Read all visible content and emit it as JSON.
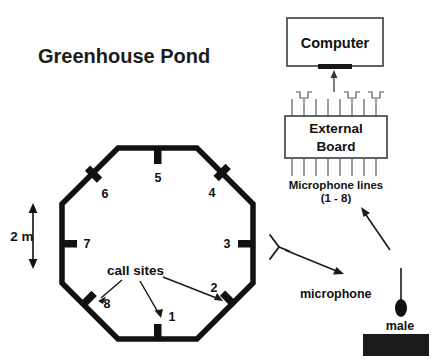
{
  "title": "Greenhouse Pond",
  "scale": {
    "label": "2 m",
    "icon": "double-headed-arrow-icon"
  },
  "pond": {
    "name": "octagonal pond outline",
    "shape": "octagon",
    "stroke_color": "#111111",
    "microphones": [
      {
        "id": "1",
        "label": "1",
        "edge": "bottom"
      },
      {
        "id": "2",
        "label": "2",
        "edge": "bottom-right"
      },
      {
        "id": "3",
        "label": "3",
        "edge": "right"
      },
      {
        "id": "4",
        "label": "4",
        "edge": "top-right"
      },
      {
        "id": "5",
        "label": "5",
        "edge": "top"
      },
      {
        "id": "6",
        "label": "6",
        "edge": "top-left"
      },
      {
        "id": "7",
        "label": "7",
        "edge": "left"
      },
      {
        "id": "8",
        "label": "8",
        "edge": "bottom-left"
      }
    ]
  },
  "annotations": {
    "call_sites": "call sites",
    "microphone": "microphone",
    "male": "male",
    "microphone_lines": "Microphone lines",
    "microphone_lines_range": "(1 - 8)"
  },
  "equipment": {
    "computer": "Computer",
    "external_board_line1": "External",
    "external_board_line2": "Board",
    "signal_line_count": 8
  },
  "redaction": {
    "name": "redacted-block",
    "color": "#1a1a1a"
  },
  "colors": {
    "ink": "#111111",
    "line": "#4a4a4a",
    "background": "#ffffff"
  }
}
